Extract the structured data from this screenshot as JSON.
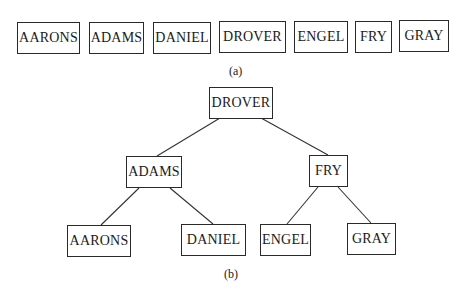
{
  "part_a": {
    "caption": "(a)",
    "records": [
      "AARONS",
      "ADAMS",
      "DANIEL",
      "DROVER",
      "ENGEL",
      "FRY",
      "GRAY"
    ]
  },
  "part_b": {
    "caption": "(b)",
    "tree": {
      "root": "DROVER",
      "level1": [
        "ADAMS",
        "FRY"
      ],
      "level2": [
        "AARONS",
        "DANIEL",
        "ENGEL",
        "GRAY"
      ]
    }
  }
}
